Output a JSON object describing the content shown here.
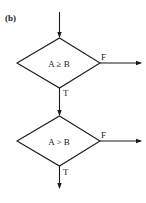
{
  "panel_label": "(b)",
  "colors": {
    "ink": "#1a1a1a",
    "background": "#ffffff"
  },
  "nodes": [
    {
      "id": "decision-1",
      "shape": "diamond",
      "label": "A ≥ B"
    },
    {
      "id": "decision-2",
      "shape": "diamond",
      "label": "A > B"
    }
  ],
  "edges": [
    {
      "from": "entry",
      "to": "decision-1",
      "label": ""
    },
    {
      "from": "decision-1",
      "to": "exit-right-1",
      "label": "F"
    },
    {
      "from": "decision-1",
      "to": "decision-2",
      "label": "T"
    },
    {
      "from": "decision-2",
      "to": "exit-right-2",
      "label": "F"
    },
    {
      "from": "decision-2",
      "to": "exit-down",
      "label": "T"
    }
  ]
}
